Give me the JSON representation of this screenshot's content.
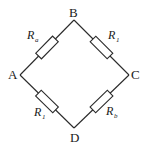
{
  "diagram": {
    "type": "wheatstone-bridge-circuit",
    "nodes": [
      {
        "id": "A",
        "label": "A",
        "x": 20,
        "y": 75
      },
      {
        "id": "B",
        "label": "B",
        "x": 74,
        "y": 20
      },
      {
        "id": "C",
        "label": "C",
        "x": 129,
        "y": 75
      },
      {
        "id": "D",
        "label": "D",
        "x": 74,
        "y": 128
      }
    ],
    "resistors": [
      {
        "id": "AB",
        "from": "A",
        "to": "B",
        "symbol": "R",
        "subscript": "a"
      },
      {
        "id": "BC",
        "from": "B",
        "to": "C",
        "symbol": "R",
        "subscript": "1"
      },
      {
        "id": "AD",
        "from": "A",
        "to": "D",
        "symbol": "R",
        "subscript": "1"
      },
      {
        "id": "DC",
        "from": "D",
        "to": "C",
        "symbol": "R",
        "subscript": "b"
      }
    ],
    "colors": {
      "line": "#2a2a2a",
      "background": "#ffffff"
    }
  }
}
